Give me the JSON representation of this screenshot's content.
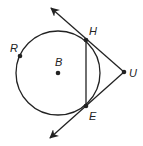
{
  "diagram": {
    "type": "geometry",
    "colors": {
      "stroke": "#222222",
      "background": "#ffffff"
    },
    "circle": {
      "center_label": "B",
      "cx": 58,
      "cy": 73,
      "r": 42
    },
    "points": {
      "R": {
        "label": "R",
        "x": 20,
        "y": 56
      },
      "B": {
        "label": "B",
        "x": 58,
        "y": 73
      },
      "H": {
        "label": "H",
        "x": 86,
        "y": 40
      },
      "E": {
        "label": "E",
        "x": 86,
        "y": 106
      },
      "U": {
        "label": "U",
        "x": 124,
        "y": 72
      }
    },
    "segments": [
      {
        "from": "H",
        "to": "E",
        "name": "chord-HE"
      },
      {
        "from": "H",
        "to": "U",
        "name": "segment-HU"
      },
      {
        "from": "E",
        "to": "U",
        "name": "segment-EU"
      }
    ],
    "rays": [
      {
        "from": "U",
        "through": "H",
        "name": "tangent-ray-UH"
      },
      {
        "from": "U",
        "through": "E",
        "name": "tangent-ray-UE"
      }
    ]
  }
}
